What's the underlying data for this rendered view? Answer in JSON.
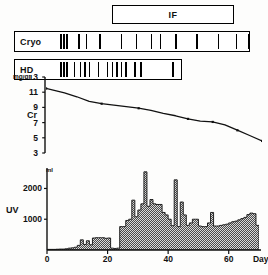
{
  "figure": {
    "caption_hidden": "",
    "treatment_box": {
      "label": "IF"
    },
    "event_rows": [
      {
        "id": "cryo",
        "label": "Cryo",
        "tick_days": [
          4.0,
          5.0,
          6.0,
          10.0,
          12.5,
          17.0,
          24.0,
          29.0,
          34.0,
          37.0,
          42.0,
          49.0,
          56.0,
          62.0,
          66.0
        ]
      },
      {
        "id": "hd",
        "label": "HD",
        "tick_days": [
          4.0,
          5.0,
          6.0,
          8.5,
          10.5,
          12.0,
          13.5,
          16.5,
          19.5,
          21.0,
          22.5,
          24.0,
          25.5,
          28.5,
          30.5,
          41.0
        ]
      }
    ]
  },
  "chart_data": [
    {
      "id": "cr-chart",
      "type": "line",
      "title": "",
      "series_label": "Cr",
      "ylabel": "mg/dl",
      "xlabel": "",
      "ylim": [
        3,
        13
      ],
      "xlim": [
        0,
        70
      ],
      "yticks": [
        13,
        11,
        9,
        7,
        5,
        3
      ],
      "grid": false,
      "legend": "none",
      "x": [
        0,
        3,
        6,
        10,
        14,
        18,
        22,
        26,
        30,
        34,
        38,
        42,
        46,
        50,
        54,
        58,
        62,
        66,
        70
      ],
      "values": [
        11.5,
        11.2,
        10.9,
        10.4,
        9.8,
        9.5,
        9.3,
        9.1,
        8.9,
        8.6,
        8.2,
        7.9,
        7.5,
        7.2,
        7.1,
        6.7,
        6.0,
        5.3,
        4.6
      ],
      "markers_x": [
        0,
        18,
        30,
        46,
        54,
        62,
        70
      ]
    },
    {
      "id": "uv-chart",
      "type": "bar",
      "title": "",
      "series_label": "UV",
      "ylabel": "ml",
      "xlabel": "Day",
      "ylim": [
        0,
        2600
      ],
      "xlim": [
        0,
        70
      ],
      "yticks": [
        1000,
        2000
      ],
      "xticks": [
        0,
        20,
        40,
        60
      ],
      "grid": false,
      "legend": "none",
      "categories": [
        0,
        1,
        2,
        3,
        4,
        5,
        6,
        7,
        8,
        9,
        10,
        11,
        12,
        13,
        14,
        15,
        16,
        17,
        18,
        19,
        20,
        21,
        22,
        23,
        24,
        25,
        26,
        27,
        28,
        29,
        30,
        31,
        32,
        33,
        34,
        35,
        36,
        37,
        38,
        39,
        40,
        41,
        42,
        43,
        44,
        45,
        46,
        47,
        48,
        49,
        50,
        51,
        52,
        53,
        54,
        55,
        56,
        57,
        58,
        59,
        60,
        61,
        62,
        63,
        64,
        65,
        66,
        67,
        68,
        69
      ],
      "values": [
        20,
        20,
        20,
        25,
        30,
        30,
        40,
        60,
        70,
        90,
        150,
        330,
        180,
        300,
        170,
        390,
        400,
        400,
        400,
        380,
        390,
        60,
        50,
        60,
        760,
        760,
        960,
        1000,
        1620,
        1080,
        1300,
        1500,
        2540,
        1420,
        1640,
        1500,
        1480,
        1480,
        1220,
        1140,
        1000,
        790,
        2280,
        760,
        1560,
        1140,
        800,
        880,
        1000,
        1000,
        780,
        760,
        760,
        880,
        1220,
        780,
        780,
        800,
        820,
        840,
        880,
        920,
        940,
        980,
        1020,
        1060,
        1150,
        1200,
        1180,
        800
      ]
    }
  ]
}
